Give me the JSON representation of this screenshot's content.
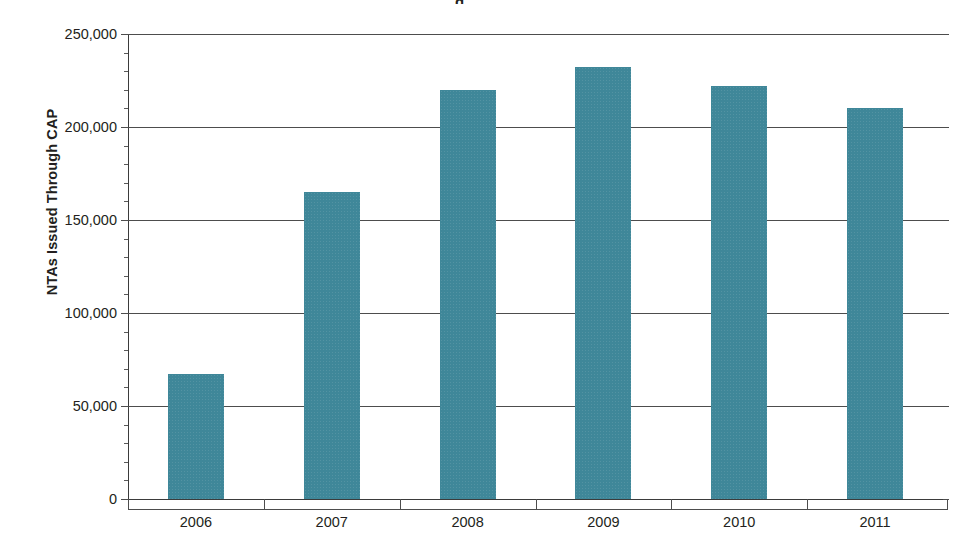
{
  "chart_data": {
    "type": "bar",
    "title": "",
    "xlabel": "",
    "ylabel": "NTAs Issued Through CAP",
    "categories": [
      "2006",
      "2007",
      "2008",
      "2009",
      "2010",
      "2011"
    ],
    "values": [
      67000,
      165000,
      220000,
      232000,
      222000,
      210000
    ],
    "ylim": [
      0,
      250000
    ],
    "ytick_labels": [
      "0",
      "50,000",
      "100,000",
      "150,000",
      "200,000",
      "250,000"
    ],
    "ytick_values": [
      0,
      50000,
      100000,
      150000,
      200000,
      250000
    ],
    "minor_tick_interval": 10000,
    "grid": true,
    "grid_axis": "y",
    "legend": "none",
    "bar_color": "#3f8799",
    "axis_color": "#4d4d4d",
    "background_color": "#ffffff",
    "series": [
      {
        "name": "NTAs Issued Through CAP",
        "values": [
          67000,
          165000,
          220000,
          232000,
          222000,
          210000
        ]
      }
    ]
  },
  "figure": {
    "title_sliver": "g"
  }
}
